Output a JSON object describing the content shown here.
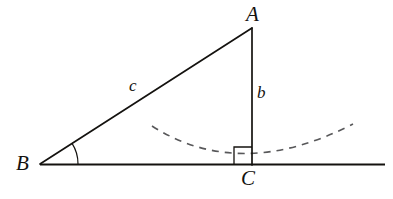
{
  "figure": {
    "type": "geometry-diagram",
    "canvas": {
      "width": 393,
      "height": 199,
      "background": "#ffffff"
    },
    "ink_color": "#14120f",
    "dash_color": "#58585a",
    "vertices": [
      {
        "name": "A",
        "label": "A",
        "x": 252,
        "y": 28
      },
      {
        "name": "B",
        "label": "B",
        "x": 40,
        "y": 164
      },
      {
        "name": "C",
        "label": "C",
        "x": 252,
        "y": 165
      }
    ],
    "sides": [
      {
        "name": "hypotenuse",
        "label": "c",
        "from": "B",
        "to": "A",
        "label_x": 136,
        "label_y": 87
      },
      {
        "name": "vertical-leg",
        "label": "b",
        "from": "A",
        "to": "C",
        "label_x": 264,
        "label_y": 94
      },
      {
        "name": "base-leg",
        "label": "",
        "from": "B",
        "to": "C"
      }
    ],
    "baseline": {
      "x1": 40,
      "y1": 164,
      "x2": 385,
      "y2": 164
    },
    "angle_arc": {
      "at": "B",
      "radius": 38,
      "start_deg": 0,
      "end_deg": 33
    },
    "right_angle_marker": {
      "at": "C",
      "size": 18,
      "side": "left"
    },
    "dashed_curve": {
      "kind": "parabola",
      "vertex_x": 240,
      "vertex_y": 164,
      "left_end_x": 152,
      "left_end_y": 126,
      "right_end_x": 353,
      "right_end_y": 124,
      "dash_pattern": "7 6"
    },
    "labels": {
      "A": "A",
      "B": "B",
      "C": "C",
      "c": "c",
      "b": "b"
    }
  }
}
